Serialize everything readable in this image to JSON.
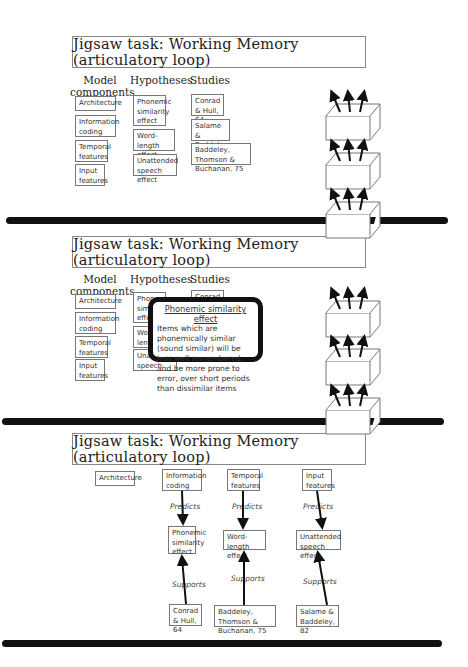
{
  "panels": [
    {
      "title": "Jigsaw task: Working Memory (articulatory loop)",
      "headers": {
        "components": "Model\ncomponents",
        "hypotheses": "Hypotheses",
        "studies": "Studies"
      },
      "components": [
        "Architecture",
        "Information coding",
        "Temporal features",
        "Input features"
      ],
      "hypotheses": [
        "Phonemic similarity effect",
        "Word-length effect",
        "Unattended speech effect"
      ],
      "studies": [
        "Conrad & Hull, 64",
        "Salame & Baddeley, 82",
        "Baddeley, Thomson & Buchanan, 75"
      ],
      "crates": [
        "Predicts",
        "Supports",
        "Refutes"
      ]
    },
    {
      "title": "Jigsaw task: Working Memory (articulatory loop)",
      "headers": {
        "components": "Model\ncomponents",
        "hypotheses": "Hypotheses",
        "studies": "Studies"
      },
      "components": [
        "Architecture",
        "Information coding",
        "Temporal features",
        "Input features"
      ],
      "hypotheses": [
        "Phonemic similarity effect",
        "Word-length effect",
        "Unattended speech effect"
      ],
      "studies": [
        "Conrad & Hull, 64"
      ],
      "crates": [
        "Predicts",
        "Supports",
        "Refutes"
      ],
      "tooltip": {
        "title": "Phonemic similarity effect",
        "body": "Items which are phonemically similar (sound similar) will be less well remembered, and be more prone to error, over short periods than dissimilar items"
      }
    },
    {
      "title": "Jigsaw task: Working Memory (articulatory loop)",
      "components": [
        "Architecture",
        "Information coding",
        "Temporal features",
        "Input features"
      ],
      "hypotheses": [
        "Phonemic similarity effect",
        "Word-length effect",
        "Unattended speech effect"
      ],
      "studies": [
        "Conrad & Hull, 64",
        "Baddeley, Thomson & Buchanan, 75",
        "Salame & Baddeley, 82"
      ],
      "edge_labels": {
        "predicts": "Predicts",
        "supports": "Supports"
      }
    }
  ]
}
